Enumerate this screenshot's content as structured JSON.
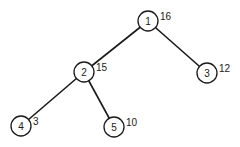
{
  "diagram": {
    "type": "binary-tree",
    "nodes": [
      {
        "id": "1",
        "value": "16",
        "cx": 148,
        "cy": 21
      },
      {
        "id": "2",
        "value": "15",
        "cx": 84,
        "cy": 72
      },
      {
        "id": "3",
        "value": "12",
        "cx": 207,
        "cy": 73
      },
      {
        "id": "4",
        "value": "3",
        "cx": 21,
        "cy": 126
      },
      {
        "id": "5",
        "value": "10",
        "cx": 114,
        "cy": 127
      }
    ],
    "edges": [
      {
        "from": "1",
        "to": "2"
      },
      {
        "from": "1",
        "to": "3"
      },
      {
        "from": "2",
        "to": "4"
      },
      {
        "from": "2",
        "to": "5"
      }
    ]
  }
}
